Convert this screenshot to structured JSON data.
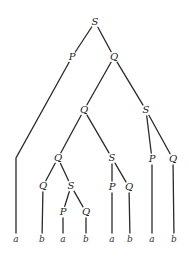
{
  "diagram": {
    "type": "parse-tree",
    "nodes": [
      {
        "id": "n0",
        "label": "S",
        "x": 95,
        "y": 22
      },
      {
        "id": "n1",
        "label": "P",
        "x": 72,
        "y": 57
      },
      {
        "id": "n2",
        "label": "Q",
        "x": 114,
        "y": 57
      },
      {
        "id": "n3",
        "label": "Q",
        "x": 84,
        "y": 110
      },
      {
        "id": "n4",
        "label": "S",
        "x": 146,
        "y": 110
      },
      {
        "id": "n5",
        "label": "Q",
        "x": 58,
        "y": 158
      },
      {
        "id": "n6",
        "label": "S",
        "x": 112,
        "y": 158
      },
      {
        "id": "n7",
        "label": "P",
        "x": 152,
        "y": 159
      },
      {
        "id": "n8",
        "label": "Q",
        "x": 173,
        "y": 159
      },
      {
        "id": "n9",
        "label": "Q",
        "x": 43,
        "y": 186
      },
      {
        "id": "n10",
        "label": "S",
        "x": 71,
        "y": 186
      },
      {
        "id": "n11",
        "label": "P",
        "x": 112,
        "y": 187
      },
      {
        "id": "n12",
        "label": "Q",
        "x": 129,
        "y": 187
      },
      {
        "id": "n13",
        "label": "P",
        "x": 63,
        "y": 212
      },
      {
        "id": "n14",
        "label": "Q",
        "x": 86,
        "y": 212
      }
    ],
    "leaves": [
      {
        "id": "l0",
        "label": "a",
        "x": 16,
        "y": 239
      },
      {
        "id": "l1",
        "label": "b",
        "x": 42,
        "y": 239
      },
      {
        "id": "l2",
        "label": "a",
        "x": 63,
        "y": 239
      },
      {
        "id": "l3",
        "label": "b",
        "x": 86,
        "y": 239
      },
      {
        "id": "l4",
        "label": "a",
        "x": 112,
        "y": 239
      },
      {
        "id": "l5",
        "label": "b",
        "x": 130,
        "y": 239
      },
      {
        "id": "l6",
        "label": "a",
        "x": 152,
        "y": 239
      },
      {
        "id": "l7",
        "label": "b",
        "x": 174,
        "y": 239
      }
    ],
    "edges": [
      {
        "from": "n0",
        "to": "n1"
      },
      {
        "from": "n0",
        "to": "n2"
      },
      {
        "from": "n1",
        "to": "l0",
        "via": [
          16,
          158
        ]
      },
      {
        "from": "n2",
        "to": "n3"
      },
      {
        "from": "n2",
        "to": "n4"
      },
      {
        "from": "n3",
        "to": "n5"
      },
      {
        "from": "n3",
        "to": "n6"
      },
      {
        "from": "n4",
        "to": "n7"
      },
      {
        "from": "n4",
        "to": "n8"
      },
      {
        "from": "n5",
        "to": "n9"
      },
      {
        "from": "n5",
        "to": "n10"
      },
      {
        "from": "n6",
        "to": "n11"
      },
      {
        "from": "n6",
        "to": "n12"
      },
      {
        "from": "n7",
        "to": "l6"
      },
      {
        "from": "n8",
        "to": "l7"
      },
      {
        "from": "n9",
        "to": "l1"
      },
      {
        "from": "n10",
        "to": "n13"
      },
      {
        "from": "n10",
        "to": "n14"
      },
      {
        "from": "n11",
        "to": "l4"
      },
      {
        "from": "n12",
        "to": "l5"
      },
      {
        "from": "n13",
        "to": "l2"
      },
      {
        "from": "n14",
        "to": "l3"
      }
    ]
  },
  "colors": {
    "background": "#ffffff",
    "line": "#2a2a2a",
    "text": "#222222"
  }
}
